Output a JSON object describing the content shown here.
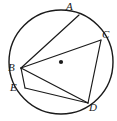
{
  "figure": {
    "kind": "circle-geometry-diagram",
    "background_color": "#ffffff",
    "stroke_color": "#1a1a1a",
    "label_color": "#1a1a1a",
    "circle": {
      "name": "circumscribed-circle",
      "center_x": 61,
      "center_y": 62,
      "radius": 52,
      "stroke_width": 1.4
    },
    "center_dot": {
      "name": "center-point",
      "x": 61,
      "y": 62,
      "radius": 2.1
    },
    "points": [
      {
        "id": "A",
        "label": "A",
        "x": 79,
        "y": 15,
        "label_x": 66,
        "label_y": 1
      },
      {
        "id": "B",
        "label": "B",
        "x": 21,
        "y": 68,
        "label_x": 8,
        "label_y": 62
      },
      {
        "id": "C",
        "label": "C",
        "x": 101,
        "y": 40,
        "label_x": 102,
        "label_y": 29
      },
      {
        "id": "D",
        "label": "D",
        "x": 88,
        "y": 103,
        "label_x": 89,
        "label_y": 102
      },
      {
        "id": "E",
        "label": "E",
        "x": 25,
        "y": 88,
        "label_x": 10,
        "label_y": 82
      }
    ],
    "chords": [
      {
        "name": "chord-B-A",
        "from": "B",
        "to": "A"
      },
      {
        "name": "chord-B-C",
        "from": "B",
        "to": "C"
      },
      {
        "name": "chord-B-E",
        "from": "B",
        "to": "E"
      },
      {
        "name": "chord-B-D",
        "from": "B",
        "to": "D"
      },
      {
        "name": "chord-E-D",
        "from": "E",
        "to": "D"
      },
      {
        "name": "chord-C-D",
        "from": "C",
        "to": "D"
      }
    ]
  }
}
